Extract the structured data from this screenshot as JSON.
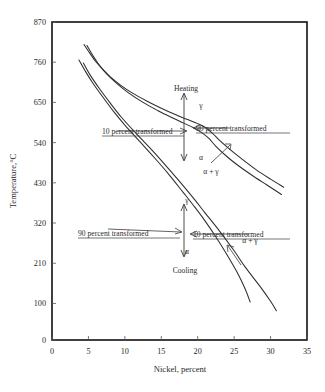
{
  "chart_data": {
    "type": "line",
    "title": "",
    "xlabel": "Nickel, percent",
    "ylabel": "Temperature,°C",
    "xlim": [
      0,
      35
    ],
    "ylim": [
      0,
      870
    ],
    "xticks": [
      "0",
      "5",
      "10",
      "15",
      "20",
      "25",
      "30",
      "35"
    ],
    "yticks": [
      "0",
      "100",
      "210",
      "320",
      "430",
      "540",
      "650",
      "760",
      "870"
    ],
    "xtick_values": [
      0,
      5,
      10,
      15,
      20,
      25,
      30,
      35
    ],
    "ytick_values": [
      0,
      100,
      210,
      320,
      430,
      540,
      650,
      760,
      870
    ],
    "grid": false,
    "legend": "none",
    "series": [
      {
        "name": "Heating, 10 percent transformed",
        "points": [
          [
            4.4,
            808
          ],
          [
            5.0,
            790
          ],
          [
            6.0,
            762
          ],
          [
            7.0,
            740
          ],
          [
            8.0,
            720
          ],
          [
            9.5,
            696
          ],
          [
            11.0,
            676
          ],
          [
            13.0,
            654
          ],
          [
            15.0,
            634
          ],
          [
            17.0,
            616
          ],
          [
            18.5,
            604
          ],
          [
            20.0,
            592
          ],
          [
            21.0,
            582
          ],
          [
            22.0,
            566
          ],
          [
            23.0,
            546
          ],
          [
            24.5,
            520
          ],
          [
            26.0,
            496
          ],
          [
            28.0,
            466
          ],
          [
            30.0,
            440
          ],
          [
            31.8,
            418
          ]
        ]
      },
      {
        "name": "Heating, 90 percent transformed",
        "points": [
          [
            4.8,
            806
          ],
          [
            5.5,
            782
          ],
          [
            6.5,
            752
          ],
          [
            7.5,
            728
          ],
          [
            9.0,
            700
          ],
          [
            10.5,
            676
          ],
          [
            12.5,
            650
          ],
          [
            14.5,
            628
          ],
          [
            16.5,
            608
          ],
          [
            18.0,
            594
          ],
          [
            19.5,
            580
          ],
          [
            20.5,
            568
          ],
          [
            21.5,
            552
          ],
          [
            22.5,
            530
          ],
          [
            24.0,
            502
          ],
          [
            25.5,
            478
          ],
          [
            27.5,
            450
          ],
          [
            29.5,
            424
          ],
          [
            31.5,
            398
          ]
        ]
      },
      {
        "name": "Cooling, 90 percent transformed",
        "points": [
          [
            3.7,
            766
          ],
          [
            4.5,
            738
          ],
          [
            5.5,
            706
          ],
          [
            7.0,
            664
          ],
          [
            8.5,
            624
          ],
          [
            10.0,
            588
          ],
          [
            12.0,
            544
          ],
          [
            14.0,
            500
          ],
          [
            16.0,
            454
          ],
          [
            18.0,
            404
          ],
          [
            19.5,
            366
          ],
          [
            21.0,
            326
          ],
          [
            22.5,
            282
          ],
          [
            24.0,
            234
          ],
          [
            25.5,
            182
          ],
          [
            26.5,
            140
          ],
          [
            27.2,
            104
          ]
        ]
      },
      {
        "name": "Cooling, 10 percent transformed",
        "points": [
          [
            4.3,
            758
          ],
          [
            5.2,
            726
          ],
          [
            6.5,
            688
          ],
          [
            8.0,
            648
          ],
          [
            9.5,
            610
          ],
          [
            11.5,
            566
          ],
          [
            13.5,
            524
          ],
          [
            15.5,
            480
          ],
          [
            17.5,
            434
          ],
          [
            19.5,
            386
          ],
          [
            21.0,
            348
          ],
          [
            23.0,
            298
          ],
          [
            25.0,
            244
          ],
          [
            26.5,
            200
          ],
          [
            28.5,
            148
          ],
          [
            30.0,
            106
          ],
          [
            30.8,
            80
          ]
        ]
      }
    ],
    "annotations": [
      {
        "id": "heating-label",
        "text": "Heating",
        "x": 18.7,
        "y": 700
      },
      {
        "id": "cooling-label",
        "text": "Cooling",
        "x": 18.3,
        "y": 148
      },
      {
        "id": "heating-gamma",
        "text": "γ",
        "x": 20.6,
        "y": 661
      },
      {
        "id": "heating-alpha",
        "text": "α",
        "x": 20.6,
        "y": 520
      },
      {
        "id": "cooling-gamma",
        "text": "γ",
        "x": 18.7,
        "y": 336
      },
      {
        "id": "cooling-alpha",
        "text": "α",
        "x": 18.7,
        "y": 196
      },
      {
        "id": "heating-alpha-gamma",
        "text": "α + γ",
        "x": 22.6,
        "y": 466
      },
      {
        "id": "cooling-alpha-gamma",
        "text": "α + γ",
        "x": 25.4,
        "y": 200
      },
      {
        "id": "heating-10-percent",
        "text": "10 percent transformed",
        "x": 9.6,
        "y": 580
      },
      {
        "id": "heating-90-percent",
        "text": "90 percent transformed",
        "x": 23.2,
        "y": 580
      },
      {
        "id": "cooling-90-percent",
        "text": "90 percent transformed",
        "x": 7.8,
        "y": 263
      },
      {
        "id": "cooling-10-percent",
        "text": "10 percent transformed",
        "x": 21.2,
        "y": 263
      }
    ]
  },
  "labels": {
    "ylabel": "Temperature,°C",
    "xlabel": "Nickel, percent",
    "heating": "Heating",
    "cooling": "Cooling",
    "gamma": "γ",
    "alpha": "α",
    "alpha_plus_gamma": "α + γ",
    "ten_percent": "10 percent transformed",
    "ninety_percent": "90 percent transformed"
  },
  "ytick_labels": [
    "870",
    "760",
    "650",
    "540",
    "430",
    "320",
    "210",
    "100",
    "0"
  ],
  "xtick_labels": [
    "0",
    "5",
    "10",
    "15",
    "20",
    "25",
    "30",
    "35"
  ],
  "colors": {
    "curve": "#2e2e2e",
    "frame": "#111111",
    "text": "#2a2a2a",
    "background": "#ffffff"
  }
}
